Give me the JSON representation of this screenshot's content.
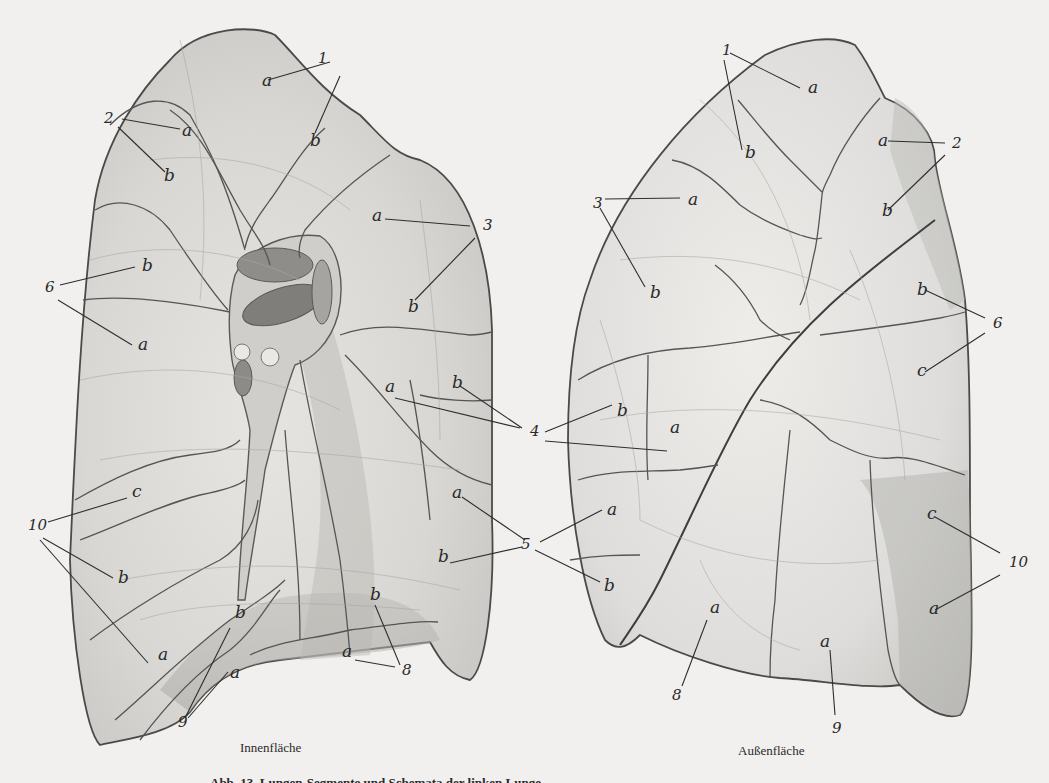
{
  "figure": {
    "type": "anatomical illustration",
    "views": [
      {
        "id": "left",
        "caption": "Innenfläche",
        "labels": [
          {
            "text": "1",
            "x": 318,
            "y": 63
          },
          {
            "text": "a",
            "x": 262,
            "y": 86
          },
          {
            "text": "b",
            "x": 310,
            "y": 146
          },
          {
            "text": "2",
            "x": 104,
            "y": 123
          },
          {
            "text": "a",
            "x": 182,
            "y": 136
          },
          {
            "text": "b",
            "x": 164,
            "y": 181
          },
          {
            "text": "a",
            "x": 372,
            "y": 221
          },
          {
            "text": "3",
            "x": 483,
            "y": 230
          },
          {
            "text": "b",
            "x": 408,
            "y": 312
          },
          {
            "text": "b",
            "x": 142,
            "y": 271
          },
          {
            "text": "6",
            "x": 45,
            "y": 292
          },
          {
            "text": "a",
            "x": 138,
            "y": 350
          },
          {
            "text": "a",
            "x": 385,
            "y": 392
          },
          {
            "text": "b",
            "x": 452,
            "y": 388
          },
          {
            "text": "c",
            "x": 132,
            "y": 497
          },
          {
            "text": "10",
            "x": 28,
            "y": 530
          },
          {
            "text": "b",
            "x": 118,
            "y": 583
          },
          {
            "text": "a",
            "x": 158,
            "y": 660
          },
          {
            "text": "b",
            "x": 235,
            "y": 618
          },
          {
            "text": "a",
            "x": 230,
            "y": 678
          },
          {
            "text": "9",
            "x": 178,
            "y": 727
          },
          {
            "text": "b",
            "x": 370,
            "y": 600
          },
          {
            "text": "a",
            "x": 342,
            "y": 657
          },
          {
            "text": "8",
            "x": 402,
            "y": 675
          },
          {
            "text": "a",
            "x": 452,
            "y": 498
          },
          {
            "text": "b",
            "x": 438,
            "y": 562
          }
        ]
      },
      {
        "id": "right",
        "caption": "Außenfläche",
        "labels": [
          {
            "text": "1",
            "x": 722,
            "y": 55
          },
          {
            "text": "a",
            "x": 808,
            "y": 93
          },
          {
            "text": "b",
            "x": 745,
            "y": 158
          },
          {
            "text": "a",
            "x": 878,
            "y": 146
          },
          {
            "text": "2",
            "x": 952,
            "y": 148
          },
          {
            "text": "b",
            "x": 882,
            "y": 216
          },
          {
            "text": "3",
            "x": 593,
            "y": 208
          },
          {
            "text": "a",
            "x": 688,
            "y": 205
          },
          {
            "text": "b",
            "x": 650,
            "y": 298
          },
          {
            "text": "b",
            "x": 917,
            "y": 295
          },
          {
            "text": "6",
            "x": 993,
            "y": 328
          },
          {
            "text": "c",
            "x": 917,
            "y": 376
          },
          {
            "text": "4",
            "x": 530,
            "y": 436
          },
          {
            "text": "b",
            "x": 617,
            "y": 416
          },
          {
            "text": "a",
            "x": 670,
            "y": 433
          },
          {
            "text": "5",
            "x": 521,
            "y": 549
          },
          {
            "text": "a",
            "x": 607,
            "y": 515
          },
          {
            "text": "b",
            "x": 604,
            "y": 591
          },
          {
            "text": "c",
            "x": 927,
            "y": 519
          },
          {
            "text": "10",
            "x": 1009,
            "y": 567
          },
          {
            "text": "a",
            "x": 929,
            "y": 614
          },
          {
            "text": "a",
            "x": 710,
            "y": 613
          },
          {
            "text": "8",
            "x": 672,
            "y": 700
          },
          {
            "text": "a",
            "x": 820,
            "y": 647
          },
          {
            "text": "9",
            "x": 832,
            "y": 733
          }
        ]
      }
    ],
    "caption_main": "Abb. 13. Lungen-Segmente und Schemata der linken Lunge"
  }
}
